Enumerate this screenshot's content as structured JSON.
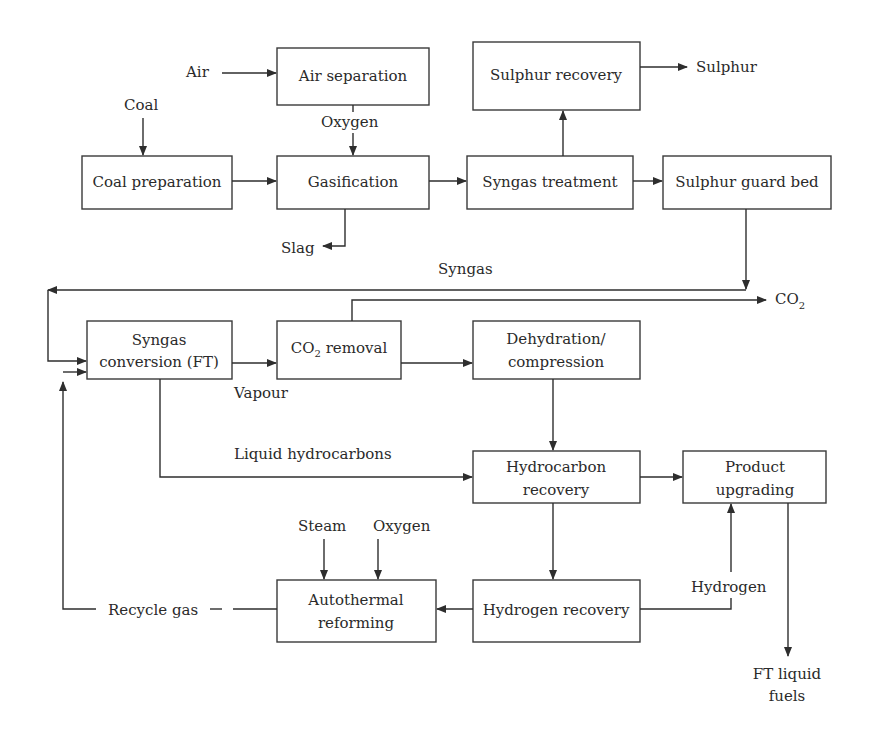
{
  "diagram": {
    "boxes": {
      "air_separation": {
        "lines": [
          "Air separation"
        ]
      },
      "sulphur_recovery": {
        "lines": [
          "Sulphur recovery"
        ]
      },
      "coal_preparation": {
        "lines": [
          "Coal preparation"
        ]
      },
      "gasification": {
        "lines": [
          "Gasification"
        ]
      },
      "syngas_treatment": {
        "lines": [
          "Syngas treatment"
        ]
      },
      "sulphur_guard_bed": {
        "lines": [
          "Sulphur guard bed"
        ]
      },
      "syngas_conversion": {
        "lines": [
          "Syngas",
          "conversion (FT)"
        ]
      },
      "co2_removal": {
        "main": "CO",
        "sub": "2",
        "rest": " removal"
      },
      "dehydration": {
        "lines": [
          "Dehydration/",
          "compression"
        ]
      },
      "hydrocarbon_recovery": {
        "lines": [
          "Hydrocarbon",
          "recovery"
        ]
      },
      "product_upgrading": {
        "lines": [
          "Product",
          "upgrading"
        ]
      },
      "autothermal_reforming": {
        "lines": [
          "Autothermal",
          "reforming"
        ]
      },
      "hydrogen_recovery": {
        "lines": [
          "Hydrogen recovery"
        ]
      }
    },
    "streams": {
      "air": "Air",
      "coal": "Coal",
      "oxygen_top": "Oxygen",
      "slag": "Slag",
      "sulphur": "Sulphur",
      "syngas": "Syngas",
      "co2": {
        "main": "CO",
        "sub": "2"
      },
      "vapour": "Vapour",
      "liquid_hydrocarbons": "Liquid hydrocarbons",
      "steam": "Steam",
      "oxygen_bottom": "Oxygen",
      "recycle_gas": "Recycle gas",
      "hydrogen": "Hydrogen",
      "ft_liquid_fuels": [
        "FT liquid",
        "fuels"
      ]
    }
  }
}
